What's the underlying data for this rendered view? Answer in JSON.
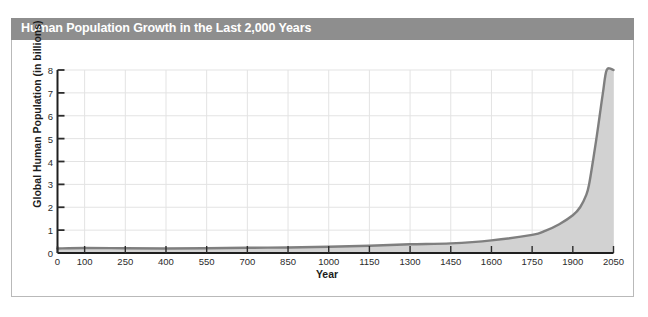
{
  "chart": {
    "title": "Human Population Growth in the Last 2,000 Years",
    "title_bar_color": "#8e8e8e",
    "title_text_color": "#ffffff",
    "frame_border_color": "#b9b9b9"
  },
  "axes": {
    "x_title": "Year",
    "y_title": "Global Human Population (in billions)"
  },
  "chart_data": {
    "type": "area",
    "title": "Human Population Growth in the Last 2,000 Years",
    "xlabel": "Year",
    "ylabel": "Global Human Population (in billions)",
    "xlim": [
      0,
      2050
    ],
    "ylim": [
      0,
      8
    ],
    "grid": true,
    "legend": null,
    "line_color": "#7f7f7f",
    "fill_color": "#d2d2d2",
    "x_ticks": [
      0,
      100,
      250,
      400,
      550,
      700,
      850,
      1000,
      1150,
      1300,
      1450,
      1600,
      1750,
      1900,
      2050
    ],
    "x_tick_labels": [
      "0",
      "100",
      "250",
      "400",
      "550",
      "700",
      "850",
      "1000",
      "1150",
      "1300",
      "1450",
      "1600",
      "1750",
      "1900",
      "2050"
    ],
    "y_ticks": [
      0,
      1,
      2,
      3,
      4,
      5,
      6,
      7,
      8
    ],
    "y_tick_labels": [
      "0",
      "1",
      "2",
      "3",
      "4",
      "5",
      "6",
      "7",
      "8"
    ],
    "x": [
      0,
      100,
      250,
      400,
      550,
      700,
      850,
      1000,
      1150,
      1300,
      1450,
      1600,
      1750,
      1800,
      1850,
      1900,
      1927,
      1950,
      1960,
      1974,
      1987,
      1999,
      2011,
      2025,
      2050
    ],
    "values": [
      0.2,
      0.22,
      0.21,
      0.2,
      0.21,
      0.23,
      0.24,
      0.27,
      0.32,
      0.38,
      0.42,
      0.55,
      0.79,
      0.98,
      1.26,
      1.65,
      2.0,
      2.55,
      3.0,
      4.0,
      5.0,
      6.0,
      7.0,
      8.0,
      8.0
    ],
    "series": [
      {
        "name": "Global human population",
        "values": [
          0.2,
          0.22,
          0.21,
          0.2,
          0.21,
          0.23,
          0.24,
          0.27,
          0.32,
          0.38,
          0.42,
          0.55,
          0.79,
          0.98,
          1.26,
          1.65,
          2.0,
          2.55,
          3.0,
          4.0,
          5.0,
          6.0,
          7.0,
          8.0,
          8.0
        ]
      }
    ]
  }
}
